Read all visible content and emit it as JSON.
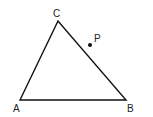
{
  "diagram": {
    "type": "geometry-triangle",
    "stroke_color": "#111111",
    "background": "#ffffff",
    "vertices": {
      "A": {
        "label": "A",
        "x": 20,
        "y": 100
      },
      "B": {
        "label": "B",
        "x": 126,
        "y": 100
      },
      "C": {
        "label": "C",
        "x": 58,
        "y": 21
      }
    },
    "point": {
      "label": "P",
      "x": 90,
      "y": 45
    },
    "labels": {
      "A": "A",
      "B": "B",
      "C": "C",
      "P": "P"
    }
  }
}
